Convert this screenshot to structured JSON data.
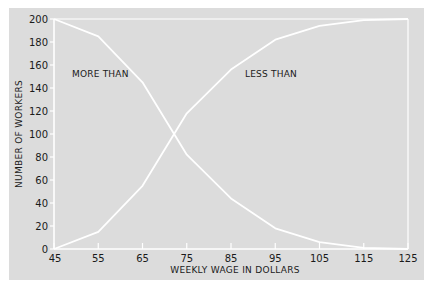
{
  "chart_data": {
    "type": "line",
    "title": "",
    "xlabel": "WEEKLY WAGE IN DOLLARS",
    "ylabel": "NUMBER OF WORKERS",
    "x": [
      45,
      55,
      65,
      75,
      85,
      95,
      105,
      115,
      125
    ],
    "x_ticks": [
      "45",
      "55",
      "65",
      "75",
      "85",
      "95",
      "105",
      "115",
      "125"
    ],
    "y_ticks": [
      "0",
      "20",
      "40",
      "60",
      "80",
      "100",
      "120",
      "140",
      "160",
      "180",
      "200"
    ],
    "xlim": [
      45,
      125
    ],
    "ylim": [
      0,
      200
    ],
    "grid": false,
    "series": [
      {
        "name": "MORE THAN",
        "values": [
          200,
          185,
          145,
          82,
          44,
          18,
          6,
          1,
          0
        ]
      },
      {
        "name": "LESS THAN",
        "values": [
          0,
          15,
          55,
          118,
          156,
          182,
          194,
          199,
          200
        ]
      }
    ],
    "annotations": [
      {
        "text": "MORE THAN",
        "x": 50,
        "y": 150
      },
      {
        "text": "LESS THAN",
        "x": 89,
        "y": 150
      }
    ],
    "legend_position": "inline annotations"
  },
  "colors": {
    "background": "#dcdcdc",
    "lines": "#ffffff",
    "text": "#1a1a1a"
  }
}
